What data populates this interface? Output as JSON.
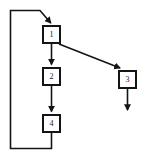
{
  "diagram": {
    "kind": "flowchart",
    "width": 145,
    "height": 159,
    "background_color": "#ffffff",
    "line_color": "#141414",
    "text_color": "#1a1a1a",
    "nodes": [
      {
        "id": "n1",
        "label": "1",
        "x": 42,
        "y": 25,
        "w": 19,
        "h": 19
      },
      {
        "id": "n2",
        "label": "2",
        "x": 42,
        "y": 67,
        "w": 19,
        "h": 19
      },
      {
        "id": "n4",
        "label": "4",
        "x": 42,
        "y": 114,
        "w": 19,
        "h": 19
      },
      {
        "id": "n3",
        "label": "3",
        "x": 118,
        "y": 70,
        "w": 19,
        "h": 19
      }
    ],
    "edges": [
      {
        "id": "e1",
        "from": "n1",
        "to": "n2",
        "style": "straight-vertical",
        "arrow": true
      },
      {
        "id": "e2",
        "from": "n2",
        "to": "n4",
        "style": "straight-vertical",
        "arrow": true
      },
      {
        "id": "e3",
        "from": "n1",
        "to": "n3",
        "style": "diagonal",
        "arrow": true
      },
      {
        "id": "e4",
        "from": "n3",
        "to": "exit",
        "style": "straight-vertical",
        "arrow": true
      },
      {
        "id": "e5",
        "from": "n4",
        "to": "n1",
        "style": "loop-back-left",
        "arrow": true
      }
    ]
  }
}
